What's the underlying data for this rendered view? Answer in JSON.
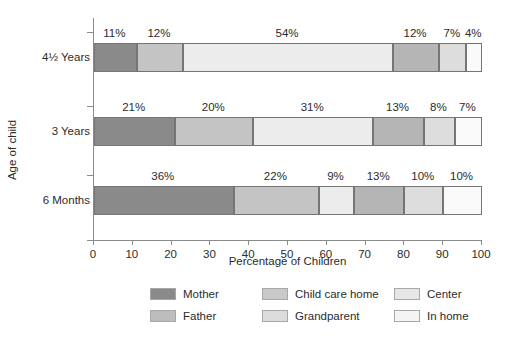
{
  "chart_data": {
    "type": "bar",
    "orientation": "horizontal",
    "stacked": true,
    "title": "",
    "xlabel": "Percentage of Children",
    "ylabel": "Age of child",
    "xlim": [
      0,
      100
    ],
    "xticks": [
      "0",
      "10",
      "20",
      "30",
      "40",
      "50",
      "60",
      "70",
      "80",
      "90",
      "100"
    ],
    "grid": false,
    "legend_position": "bottom",
    "categories": [
      "4½ Years",
      "3 Years",
      "6 Months"
    ],
    "series": [
      {
        "name": "Mother",
        "color": "#8a8a8a",
        "values": [
          11,
          21,
          36
        ]
      },
      {
        "name": "Father",
        "color": "#c4c4c4",
        "values": [
          12,
          20,
          22
        ]
      },
      {
        "name": "Child care home",
        "color": "#ececec",
        "values": [
          54,
          31,
          9
        ]
      },
      {
        "name": "Grandparent",
        "color": "#b5b5b5",
        "values": [
          12,
          13,
          13
        ]
      },
      {
        "name": "Center",
        "color": "#dddddd",
        "values": [
          7,
          8,
          10
        ]
      },
      {
        "name": "In home",
        "color": "#fafafa",
        "values": [
          4,
          7,
          10
        ]
      }
    ],
    "bars": [
      {
        "category": "4½ Years",
        "segments": [
          {
            "series": "Mother",
            "value": 11,
            "label": "11%",
            "color": "#8a8a8a"
          },
          {
            "series": "Father",
            "value": 12,
            "label": "12%",
            "color": "#c4c4c4"
          },
          {
            "series": "Child care home",
            "value": 54,
            "label": "54%",
            "color": "#ececec"
          },
          {
            "series": "Grandparent",
            "value": 12,
            "label": "12%",
            "color": "#b5b5b5"
          },
          {
            "series": "Center",
            "value": 7,
            "label": "7%",
            "color": "#dddddd"
          },
          {
            "series": "In home",
            "value": 4,
            "label": "4%",
            "color": "#fafafa"
          }
        ]
      },
      {
        "category": "3 Years",
        "segments": [
          {
            "series": "Mother",
            "value": 21,
            "label": "21%",
            "color": "#8a8a8a"
          },
          {
            "series": "Father",
            "value": 20,
            "label": "20%",
            "color": "#c4c4c4"
          },
          {
            "series": "Child care home",
            "value": 31,
            "label": "31%",
            "color": "#ececec"
          },
          {
            "series": "Grandparent",
            "value": 13,
            "label": "13%",
            "color": "#b5b5b5"
          },
          {
            "series": "Center",
            "value": 8,
            "label": "8%",
            "color": "#dddddd"
          },
          {
            "series": "In home",
            "value": 7,
            "label": "7%",
            "color": "#fafafa"
          }
        ]
      },
      {
        "category": "6 Months",
        "segments": [
          {
            "series": "Mother",
            "value": 36,
            "label": "36%",
            "color": "#8a8a8a"
          },
          {
            "series": "Father",
            "value": 22,
            "label": "22%",
            "color": "#c4c4c4"
          },
          {
            "series": "Child care home",
            "value": 9,
            "label": "9%",
            "color": "#ececec"
          },
          {
            "series": "Grandparent",
            "value": 13,
            "label": "13%",
            "color": "#b5b5b5"
          },
          {
            "series": "Center",
            "value": 10,
            "label": "10%",
            "color": "#dddddd"
          },
          {
            "series": "In home",
            "value": 10,
            "label": "10%",
            "color": "#fafafa"
          }
        ]
      }
    ],
    "legend": [
      {
        "label": "Mother",
        "color": "#8a8a8a"
      },
      {
        "label": "Child care home",
        "color": "#c9c9c9"
      },
      {
        "label": "Center",
        "color": "#e6e6e6"
      },
      {
        "label": "Father",
        "color": "#bdbdbd"
      },
      {
        "label": "Grandparent",
        "color": "#dcdcdc"
      },
      {
        "label": "In home",
        "color": "#f4f4f4"
      }
    ]
  },
  "axis": {
    "axis_color": "#8c8c8c",
    "segment_border_color": "#757575"
  }
}
